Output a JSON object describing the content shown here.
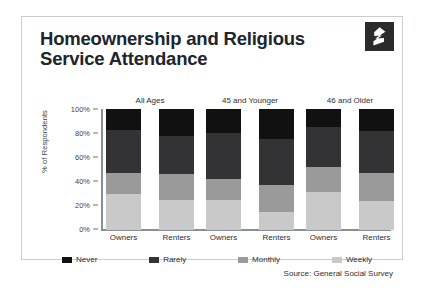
{
  "card": {
    "title_line1": "Homeownership and Religious",
    "title_line2": "Service Attendance",
    "logo_name": "zillow-z-logo",
    "source": "Source: General Social Survey"
  },
  "chart_data": {
    "type": "bar",
    "subtype": "stacked-bar-100",
    "title": "Homeownership and Religious Service Attendance",
    "xlabel": "",
    "ylabel": "% of Respondents",
    "ylim": [
      0,
      100
    ],
    "ytick_labels": [
      "100%",
      "80%",
      "60%",
      "40%",
      "20%",
      "0%"
    ],
    "ytick_values": [
      100,
      80,
      60,
      40,
      20,
      0
    ],
    "grid": false,
    "legend_position": "bottom",
    "groups": [
      "All Ages",
      "45 and Younger",
      "46 and Older"
    ],
    "categories": [
      "Owners",
      "Renters",
      "Owners",
      "Renters",
      "Owners",
      "Renters"
    ],
    "series": [
      {
        "name": "Never",
        "color": "#111111",
        "values": [
          17,
          22,
          20,
          25,
          15,
          18
        ]
      },
      {
        "name": "Rarely",
        "color": "#333336",
        "values": [
          36,
          32,
          38,
          38,
          33,
          35
        ]
      },
      {
        "name": "Monthly",
        "color": "#9a9a9a",
        "values": [
          17,
          21,
          17,
          22,
          21,
          23
        ]
      },
      {
        "name": "Weekly",
        "color": "#c9c9c9",
        "values": [
          30,
          25,
          25,
          15,
          31,
          24
        ]
      }
    ],
    "bars": [
      {
        "group": "All Ages",
        "tenure": "Owners",
        "Never": 17,
        "Rarely": 36,
        "Monthly": 17,
        "Weekly": 30
      },
      {
        "group": "All Ages",
        "tenure": "Renters",
        "Never": 22,
        "Rarely": 32,
        "Monthly": 21,
        "Weekly": 25
      },
      {
        "group": "45 and Younger",
        "tenure": "Owners",
        "Never": 20,
        "Rarely": 38,
        "Monthly": 17,
        "Weekly": 25
      },
      {
        "group": "45 and Younger",
        "tenure": "Renters",
        "Never": 25,
        "Rarely": 38,
        "Monthly": 22,
        "Weekly": 15
      },
      {
        "group": "46 and Older",
        "tenure": "Owners",
        "Never": 15,
        "Rarely": 33,
        "Monthly": 21,
        "Weekly": 31
      },
      {
        "group": "46 and Older",
        "tenure": "Renters",
        "Never": 18,
        "Rarely": 35,
        "Monthly": 23,
        "Weekly": 24
      }
    ],
    "legend": [
      {
        "label": "Never",
        "color": "#111111"
      },
      {
        "label": "Rarely",
        "color": "#333336"
      },
      {
        "label": "Monthly",
        "color": "#9a9a9a"
      },
      {
        "label": "Weekly",
        "color": "#c9c9c9"
      }
    ]
  }
}
